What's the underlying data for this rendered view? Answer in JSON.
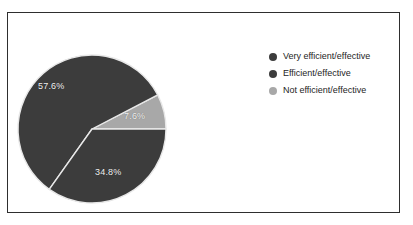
{
  "chart_data": {
    "type": "pie",
    "title": "",
    "subtitle": "",
    "xlabel": "",
    "ylabel": "",
    "grid": false,
    "legend_position": "right",
    "units": "percent",
    "start_angle_deg": 0,
    "direction": "clockwise",
    "categories": [
      "Very efficient/effective",
      "Efficient/effective",
      "Not efficient/effective"
    ],
    "values": [
      57.6,
      34.8,
      7.6
    ],
    "labels": [
      "57.6%",
      "34.8%",
      "7.6%"
    ],
    "colors": [
      "#3c3c3c",
      "#3c3c3c",
      "#a8a8a8"
    ],
    "slices": [
      {
        "name": "Very efficient/effective",
        "value": 57.6,
        "label": "57.6%",
        "color": "#3c3c3c"
      },
      {
        "name": "Efficient/effective",
        "value": 34.8,
        "label": "34.8%",
        "color": "#3c3c3c"
      },
      {
        "name": "Not efficient/effective",
        "value": 7.6,
        "label": "7.6%",
        "color": "#a8a8a8"
      }
    ]
  },
  "legend": {
    "items": [
      {
        "label": "Very efficient/effective",
        "color": "#3c3c3c"
      },
      {
        "label": "Efficient/effective",
        "color": "#3c3c3c"
      },
      {
        "label": "Not efficient/effective",
        "color": "#a8a8a8"
      }
    ]
  },
  "style": {
    "frame_color": "#2e2e2e",
    "background": "#ffffff",
    "label_color": "#f2f2f2",
    "separator_color": "#e8e8e8"
  }
}
